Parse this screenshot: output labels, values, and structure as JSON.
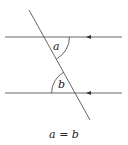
{
  "diagram": {
    "angle_labels": {
      "top": "a",
      "bottom": "b"
    },
    "caption": "a = b",
    "colors": {
      "line": "#555555",
      "text": "#222222",
      "background": "#ffffff"
    },
    "elements": {
      "parallel_lines": [
        {
          "name": "top-parallel-line",
          "y": 37,
          "x1": 5,
          "x2": 122,
          "arrow_x": 88,
          "arrow_direction": "left"
        },
        {
          "name": "bottom-parallel-line",
          "y": 93,
          "x1": 5,
          "x2": 122,
          "arrow_x": 88,
          "arrow_direction": "left"
        }
      ],
      "transversal": {
        "x1": 29,
        "y1": 10,
        "x2": 90,
        "y2": 120
      }
    }
  }
}
